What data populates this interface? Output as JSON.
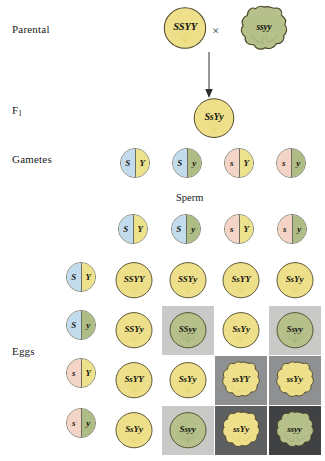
{
  "labels": {
    "parental": "Parental",
    "f1": "F",
    "f1_sub": "1",
    "gametes": "Gametes",
    "sperm": "Sperm",
    "eggs": "Eggs",
    "cross_symbol": "×"
  },
  "colors": {
    "seed_yellow": "#eee08a",
    "seed_yellow_dark": "#e3d06a",
    "seed_green": "#b6c08a",
    "seed_green_dark": "#9aa870",
    "outline": "#4a4326",
    "gamete_blue": "#c3dced",
    "gamete_pink": "#f3d4c6",
    "gamete_yellow": "#ece28c",
    "gamete_green": "#aebd86",
    "cell_bg_0": "#ffffff",
    "cell_bg_1": "#e8e8e6",
    "cell_bg_2": "#c9c9c7",
    "cell_bg_3": "#8f9091",
    "cell_bg_4": "#5d5f61",
    "cell_bg_5": "#3f4143"
  },
  "parental": {
    "left": {
      "genotype": "SSYY",
      "shape": "round",
      "color": "yellow"
    },
    "right": {
      "genotype": "ssyy",
      "shape": "wrinkled",
      "color": "green"
    }
  },
  "f1": {
    "genotype": "SsYy",
    "shape": "round",
    "color": "yellow"
  },
  "gametes": [
    {
      "allele1": "S",
      "allele2": "Y",
      "c1": "blue",
      "c2": "yellow"
    },
    {
      "allele1": "S",
      "allele2": "y",
      "c1": "blue",
      "c2": "green"
    },
    {
      "allele1": "s",
      "allele2": "Y",
      "c1": "pink",
      "c2": "yellow"
    },
    {
      "allele1": "s",
      "allele2": "y",
      "c1": "pink",
      "c2": "green"
    }
  ],
  "sperm": [
    {
      "allele1": "S",
      "allele2": "Y",
      "c1": "blue",
      "c2": "yellow"
    },
    {
      "allele1": "S",
      "allele2": "y",
      "c1": "blue",
      "c2": "green"
    },
    {
      "allele1": "s",
      "allele2": "Y",
      "c1": "pink",
      "c2": "yellow"
    },
    {
      "allele1": "s",
      "allele2": "y",
      "c1": "pink",
      "c2": "green"
    }
  ],
  "eggs": [
    {
      "allele1": "S",
      "allele2": "Y",
      "c1": "blue",
      "c2": "yellow"
    },
    {
      "allele1": "S",
      "allele2": "y",
      "c1": "blue",
      "c2": "green"
    },
    {
      "allele1": "s",
      "allele2": "Y",
      "c1": "pink",
      "c2": "yellow"
    },
    {
      "allele1": "s",
      "allele2": "y",
      "c1": "pink",
      "c2": "green"
    }
  ],
  "punnett": {
    "rows": [
      [
        {
          "genotype": "SSYY",
          "shape": "round",
          "color": "yellow",
          "bg": "cell_bg_0"
        },
        {
          "genotype": "SSYy",
          "shape": "round",
          "color": "yellow",
          "bg": "cell_bg_0"
        },
        {
          "genotype": "SsYY",
          "shape": "round",
          "color": "yellow",
          "bg": "cell_bg_0"
        },
        {
          "genotype": "SsYy",
          "shape": "round",
          "color": "yellow",
          "bg": "cell_bg_0"
        }
      ],
      [
        {
          "genotype": "SSYy",
          "shape": "round",
          "color": "yellow",
          "bg": "cell_bg_0"
        },
        {
          "genotype": "SSyy",
          "shape": "round",
          "color": "green",
          "bg": "cell_bg_2"
        },
        {
          "genotype": "SsYy",
          "shape": "round",
          "color": "yellow",
          "bg": "cell_bg_0"
        },
        {
          "genotype": "Ssyy",
          "shape": "round",
          "color": "green",
          "bg": "cell_bg_2"
        }
      ],
      [
        {
          "genotype": "SsYY",
          "shape": "round",
          "color": "yellow",
          "bg": "cell_bg_0"
        },
        {
          "genotype": "SsYy",
          "shape": "round",
          "color": "yellow",
          "bg": "cell_bg_0"
        },
        {
          "genotype": "ssYY",
          "shape": "wrinkled",
          "color": "yellow",
          "bg": "cell_bg_3"
        },
        {
          "genotype": "ssYy",
          "shape": "wrinkled",
          "color": "yellow",
          "bg": "cell_bg_3"
        }
      ],
      [
        {
          "genotype": "SsYy",
          "shape": "round",
          "color": "yellow",
          "bg": "cell_bg_0"
        },
        {
          "genotype": "Ssyy",
          "shape": "round",
          "color": "green",
          "bg": "cell_bg_2"
        },
        {
          "genotype": "ssYy",
          "shape": "wrinkled",
          "color": "yellow",
          "bg": "cell_bg_4"
        },
        {
          "genotype": "ssyy",
          "shape": "wrinkled",
          "color": "green",
          "bg": "cell_bg_5"
        }
      ]
    ]
  }
}
